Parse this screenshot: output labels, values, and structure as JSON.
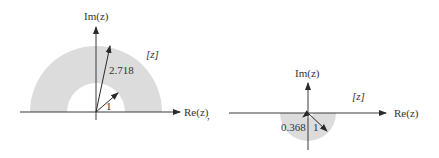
{
  "diagrams": [
    {
      "name": "z-plane-annulus-upper",
      "axis_labels": {
        "real": "Re(z)",
        "imag": "Im(z)"
      },
      "plane_label": "[z]",
      "radius_labels": {
        "outer": "2.718",
        "inner": "1"
      },
      "trailing_punctuation": ",",
      "region": "upper half annulus 1 ≤ |z| ≤ 2.718"
    },
    {
      "name": "z-plane-annulus-lower",
      "axis_labels": {
        "real": "Re(z)",
        "imag": "Im(z)"
      },
      "plane_label": "[z]",
      "radius_labels": {
        "inner": "0.368",
        "outer": "1"
      },
      "region": "lower half annulus 0.368 ≤ |z| ≤ 1"
    }
  ],
  "colors": {
    "shade": "#dcdcdc",
    "line": "#3a3a3a"
  }
}
